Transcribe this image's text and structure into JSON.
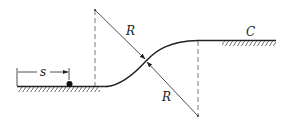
{
  "diagram": {
    "title": "",
    "labels": {
      "distance": "s",
      "radius_upper": "R",
      "radius_lower": "R",
      "point": "C"
    },
    "colors": {
      "ink": "#222222",
      "background": "#ffffff"
    },
    "elements": {
      "lower_ground": "hatched ground at left, lower level",
      "upper_ground": "hatched ground at right, upper level",
      "curve": "S-shaped reverse curve of two arcs of radius R joining the levels",
      "particle": "dot on lower ground at distance s",
      "centers": "two arc centers connected by dashed verticals"
    }
  }
}
